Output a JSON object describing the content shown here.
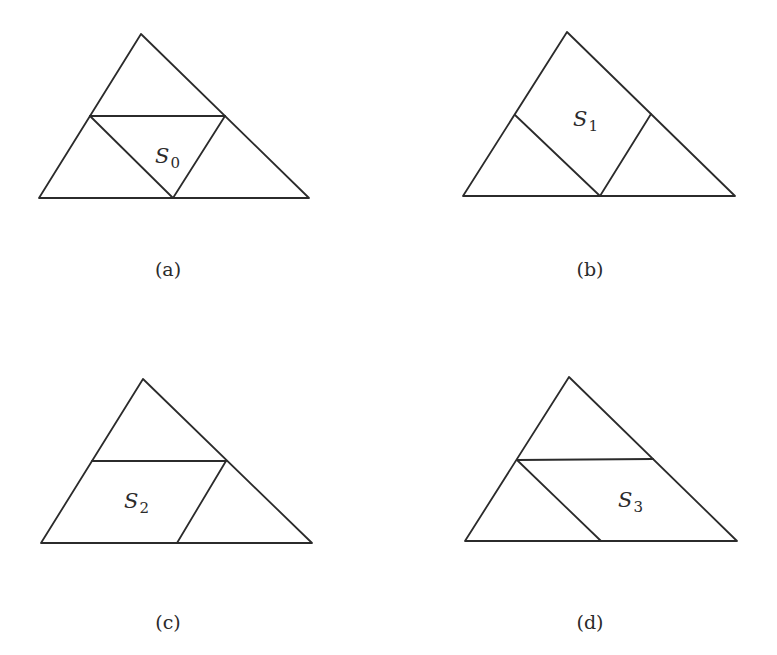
{
  "figure": {
    "panels": [
      {
        "id": "a",
        "caption": "(a)",
        "label": {
          "letter": "S",
          "sub": "0"
        },
        "shaded_region": "center triangle",
        "vertices": {
          "apex": [
            141,
            34
          ],
          "left": [
            39,
            198
          ],
          "right": [
            309,
            198
          ],
          "left_mid": [
            90,
            116
          ],
          "right_mid": [
            225,
            116
          ],
          "base_mid": [
            173,
            198
          ]
        },
        "inner_segments": [
          [
            "left_mid",
            "right_mid"
          ],
          [
            "left_mid",
            "base_mid"
          ],
          [
            "right_mid",
            "base_mid"
          ]
        ],
        "label_pos": [
          155,
          163
        ],
        "caption_pos": [
          168,
          276
        ]
      },
      {
        "id": "b",
        "caption": "(b)",
        "label": {
          "letter": "S",
          "sub": "1"
        },
        "shaded_region": "top parallelogram (top + center triangles)",
        "vertices": {
          "apex": [
            567,
            32
          ],
          "left": [
            463,
            196
          ],
          "right": [
            735,
            196
          ],
          "left_mid": [
            515,
            115
          ],
          "right_mid": [
            651,
            114
          ],
          "base_mid": [
            600,
            196
          ]
        },
        "inner_segments": [
          [
            "left_mid",
            "base_mid"
          ],
          [
            "right_mid",
            "base_mid"
          ]
        ],
        "label_pos": [
          573,
          126
        ],
        "caption_pos": [
          590,
          276
        ]
      },
      {
        "id": "c",
        "caption": "(c)",
        "label": {
          "letter": "S",
          "sub": "2"
        },
        "shaded_region": "lower-left parallelogram (left + center triangles)",
        "vertices": {
          "apex": [
            143,
            379
          ],
          "left": [
            41,
            543
          ],
          "right": [
            312,
            543
          ],
          "left_mid": [
            92,
            461
          ],
          "right_mid": [
            226,
            461
          ],
          "base_mid": [
            177,
            543
          ]
        },
        "inner_segments": [
          [
            "left_mid",
            "right_mid"
          ],
          [
            "right_mid",
            "base_mid"
          ]
        ],
        "label_pos": [
          124,
          508
        ],
        "caption_pos": [
          168,
          629
        ]
      },
      {
        "id": "d",
        "caption": "(d)",
        "label": {
          "letter": "S",
          "sub": "3"
        },
        "shaded_region": "lower-right parallelogram (right + center triangles)",
        "vertices": {
          "apex": [
            569,
            377
          ],
          "left": [
            465,
            541
          ],
          "right": [
            737,
            541
          ],
          "left_mid": [
            517,
            460
          ],
          "right_mid": [
            653,
            459
          ],
          "base_mid": [
            601,
            541
          ]
        },
        "inner_segments": [
          [
            "left_mid",
            "right_mid"
          ],
          [
            "left_mid",
            "base_mid"
          ]
        ],
        "label_pos": [
          618,
          507
        ],
        "caption_pos": [
          590,
          629
        ]
      }
    ],
    "colors": {
      "stroke": "#2b2b2b",
      "background": "#ffffff"
    }
  }
}
